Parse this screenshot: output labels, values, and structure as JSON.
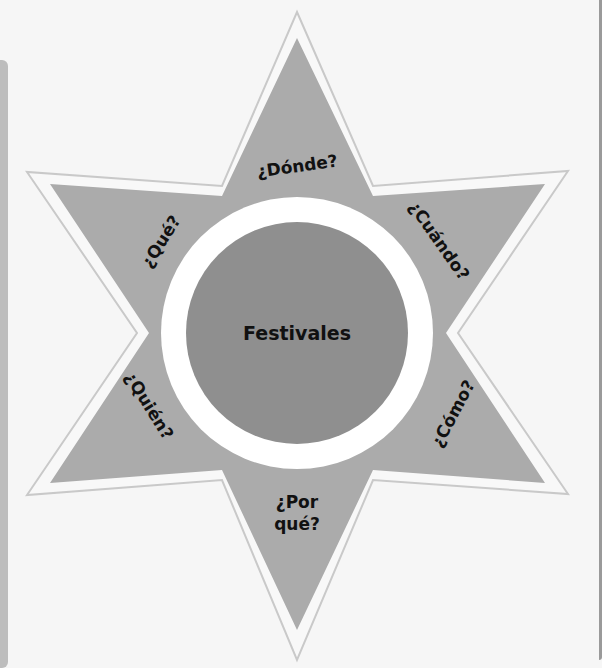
{
  "diagram": {
    "center": "Festivales",
    "points": {
      "top": "¿Dónde?",
      "upper_right": "¿Cuándo?",
      "lower_right": "¿Cómo?",
      "bottom_line1": "¿Por",
      "bottom_line2": "qué?",
      "lower_left": "¿Quién?",
      "upper_left": "¿Qué?"
    },
    "colors": {
      "background": "#f6f6f6",
      "star_fill": "#ababab",
      "star_outline": "#c9c9c9",
      "ring": "#ffffff",
      "center_fill": "#8f8f8f",
      "text": "#111111"
    }
  }
}
